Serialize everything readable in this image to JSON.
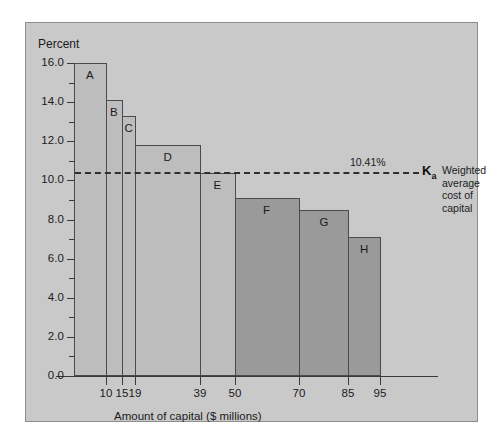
{
  "figure": {
    "background": "#ffffff",
    "panel_color": "#c9c9c9",
    "panel_border": "#8d8d8d"
  },
  "chart_data": {
    "type": "bar",
    "title": "",
    "subtitle": "",
    "xlabel": "Amount of capital ($ millions)",
    "ylabel": "Percent",
    "ylim": [
      0.0,
      16.0
    ],
    "xlim": [
      0,
      100
    ],
    "grid": false,
    "legend_position": "none",
    "y_ticks": [
      "0.0",
      "2.0",
      "4.0",
      "6.0",
      "8.0",
      "10.0",
      "12.0",
      "14.0",
      "16.0"
    ],
    "y_tick_values": [
      0.0,
      2.0,
      4.0,
      6.0,
      8.0,
      10.0,
      12.0,
      14.0,
      16.0
    ],
    "y_minor_tick_values": [
      1.0,
      3.0,
      5.0,
      7.0,
      9.0,
      11.0,
      13.0,
      15.0
    ],
    "x_ticks": [
      "10",
      "15",
      "19",
      "39",
      "50",
      "70",
      "85",
      "95"
    ],
    "x_tick_values": [
      10,
      15,
      19,
      39,
      50,
      70,
      85,
      95
    ],
    "categories": [
      "A",
      "B",
      "C",
      "D",
      "E",
      "F",
      "G",
      "H"
    ],
    "values": [
      16.0,
      14.1,
      13.3,
      11.8,
      10.4,
      9.1,
      8.5,
      7.1
    ],
    "bars": [
      {
        "label": "A",
        "cost": 16.0,
        "x_start": 0,
        "x_end": 10,
        "shade": "light"
      },
      {
        "label": "B",
        "cost": 14.1,
        "x_start": 10,
        "x_end": 15,
        "shade": "light"
      },
      {
        "label": "C",
        "cost": 13.3,
        "x_start": 15,
        "x_end": 19,
        "shade": "light"
      },
      {
        "label": "D",
        "cost": 11.8,
        "x_start": 19,
        "x_end": 39,
        "shade": "light"
      },
      {
        "label": "E",
        "cost": 10.4,
        "x_start": 39,
        "x_end": 50,
        "shade": "light"
      },
      {
        "label": "F",
        "cost": 9.1,
        "x_start": 50,
        "x_end": 70,
        "shade": "dark"
      },
      {
        "label": "G",
        "cost": 8.5,
        "x_start": 70,
        "x_end": 85,
        "shade": "dark"
      },
      {
        "label": "H",
        "cost": 7.1,
        "x_start": 85,
        "x_end": 95,
        "shade": "dark"
      }
    ],
    "annotations": [
      {
        "name": "wacc-line",
        "type": "hline",
        "value": 10.41,
        "value_text": "10.41%",
        "symbol": "K",
        "symbol_subscript": "a",
        "caption": "Weighted\naverage\ncost of\ncapital",
        "style": "dashed"
      }
    ],
    "colors": {
      "bar_light": "#bdbdbd",
      "bar_dark": "#9a9a9a",
      "bar_outline": "#4a4a4a",
      "axis": "#3a3a3a",
      "text": "#1b1b1b",
      "dashed_line": "#2f2f2f"
    }
  }
}
